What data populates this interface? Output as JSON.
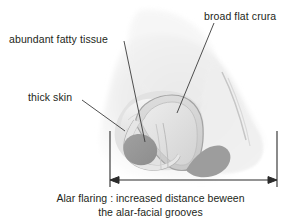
{
  "figure": {
    "title": "Alar flaring : increased distance beween the alar-facial grooves"
  },
  "labels": {
    "crura": "broad flat crura",
    "fatty_tissue": "abundant fatty tissue",
    "thick_skin": "thick skin"
  },
  "caption": {
    "line1": "Alar flaring : increased distance beween",
    "line2": "the alar-facial grooves"
  },
  "colors": {
    "text": "#231f20",
    "leader_line": "#3b3b3b",
    "dimension_line": "#2b2b2b",
    "background": "#ffffff",
    "skin_light": "#f2f2f2",
    "skin_mid": "#e4e4e4",
    "cartilage_fill": "#d9d9d9",
    "cartilage_outline": "#a8a8a8",
    "nostril_dark": "#9a9a9a",
    "shadow_gray": "#bcbcbc"
  },
  "annotations": {
    "dimension_left_x": 110,
    "dimension_right_x": 277,
    "dimension_y": 180
  }
}
